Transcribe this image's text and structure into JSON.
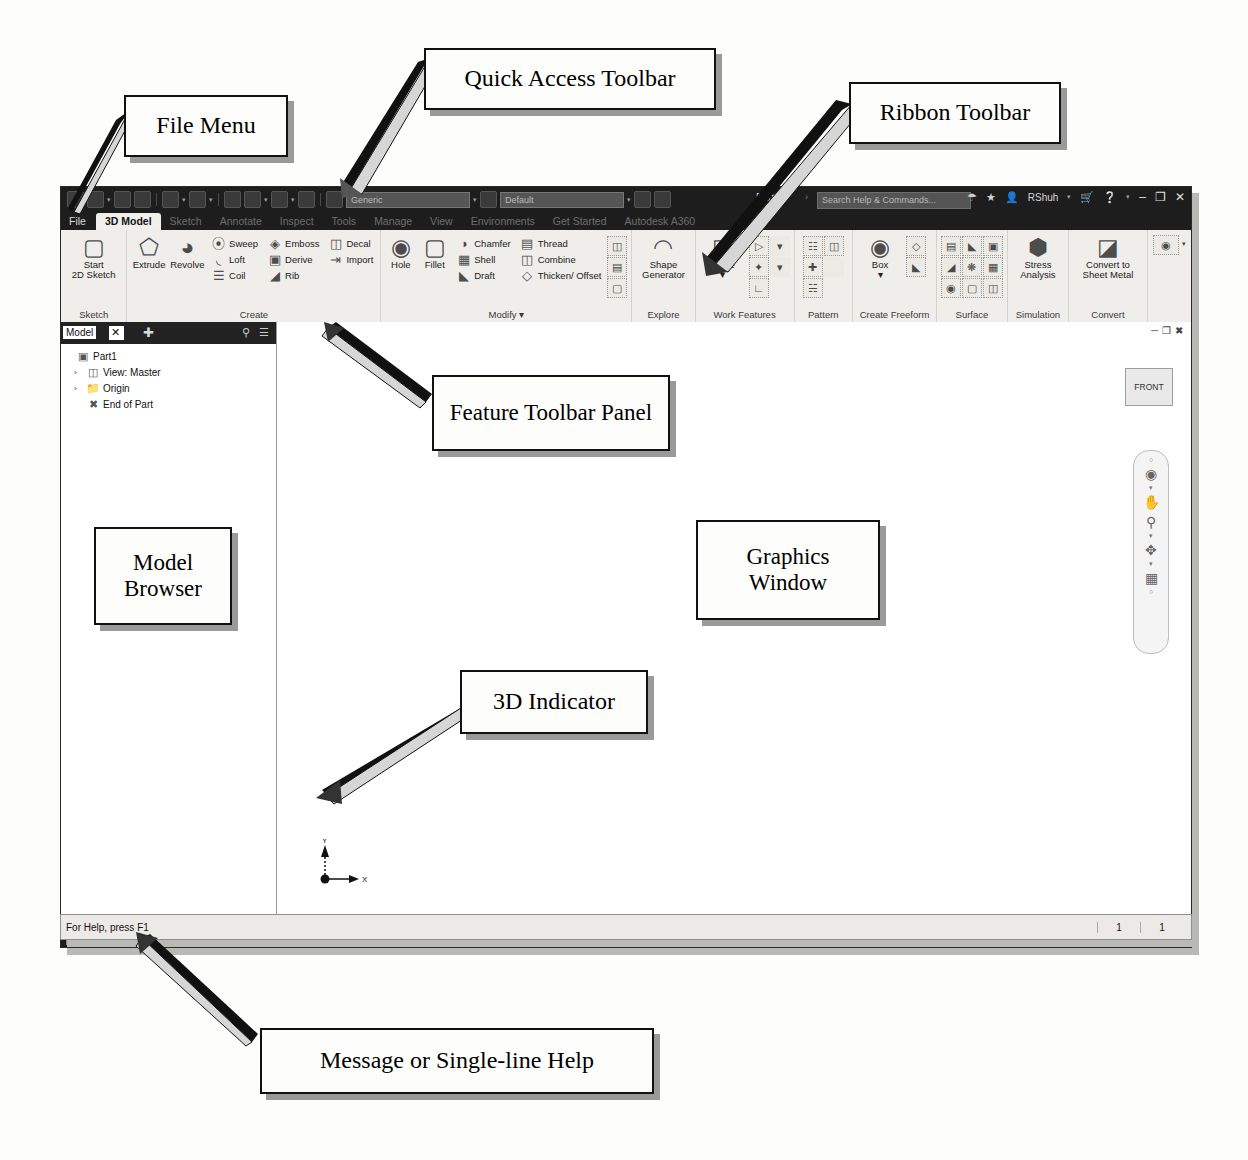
{
  "annotations": [
    {
      "id": "file-menu",
      "label": "File Menu"
    },
    {
      "id": "quick-access-toolbar",
      "label": "Quick Access Toolbar"
    },
    {
      "id": "ribbon-toolbar",
      "label": "Ribbon Toolbar"
    },
    {
      "id": "feature-toolbar-panel",
      "label": "Feature Toolbar Panel"
    },
    {
      "id": "model-browser",
      "label": "Model\nBrowser"
    },
    {
      "id": "graphics-window",
      "label": "Graphics\nWindow"
    },
    {
      "id": "3d-indicator",
      "label": "3D Indicator"
    },
    {
      "id": "message-help",
      "label": "Message or Single-line Help"
    }
  ],
  "annotation_text": {
    "file_menu": "File Menu",
    "quick_access_toolbar": "Quick Access Toolbar",
    "ribbon_toolbar": "Ribbon Toolbar",
    "feature_toolbar_panel": "Feature Toolbar Panel",
    "model_browser_l1": "Model",
    "model_browser_l2": "Browser",
    "graphics_window_l1": "Graphics",
    "graphics_window_l2": "Window",
    "three_d_indicator": "3D Indicator",
    "message_help": "Message or Single-line Help"
  },
  "titlebar": {
    "document_name": "Part1",
    "separator": "›",
    "search_placeholder": "Search Help & Commands...",
    "user_name": "RShuh",
    "material_selector": "Generic",
    "appearance_selector": "Default",
    "icons": [
      "save-icon",
      "open-icon",
      "print-icon",
      "undo-icon",
      "redo-icon",
      "home-icon",
      "update-icon",
      "material-icon",
      "appearance-icon",
      "sign-in-icon",
      "share-icon",
      "star-icon",
      "user-icon",
      "cart-icon",
      "help-icon"
    ],
    "minimize": "–",
    "maximize": "❐",
    "close": "✕"
  },
  "ribbon_tabs": [
    {
      "label": "File",
      "active": false,
      "file": true
    },
    {
      "label": "3D Model",
      "active": true,
      "file": false
    },
    {
      "label": "Sketch",
      "active": false,
      "file": false
    },
    {
      "label": "Annotate",
      "active": false,
      "file": false
    },
    {
      "label": "Inspect",
      "active": false,
      "file": false
    },
    {
      "label": "Tools",
      "active": false,
      "file": false
    },
    {
      "label": "Manage",
      "active": false,
      "file": false
    },
    {
      "label": "View",
      "active": false,
      "file": false
    },
    {
      "label": "Environments",
      "active": false,
      "file": false
    },
    {
      "label": "Get Started",
      "active": false,
      "file": false
    },
    {
      "label": "Autodesk A360",
      "active": false,
      "file": false
    }
  ],
  "ribbon_panels": {
    "sketch": {
      "title": "Sketch",
      "big": {
        "line1": "Start",
        "line2": "2D Sketch",
        "icon": "sketch-plane-icon",
        "caret": "▾"
      }
    },
    "create": {
      "title": "Create",
      "big": [
        {
          "label": "Extrude",
          "icon": "extrude-icon"
        },
        {
          "label": "Revolve",
          "icon": "revolve-icon"
        }
      ],
      "small": [
        [
          {
            "label": "Sweep",
            "icon": "sweep-icon"
          },
          {
            "label": "Loft",
            "icon": "loft-icon"
          },
          {
            "label": "Coil",
            "icon": "coil-icon"
          }
        ],
        [
          {
            "label": "Emboss",
            "icon": "emboss-icon"
          },
          {
            "label": "Derive",
            "icon": "derive-icon"
          },
          {
            "label": "Rib",
            "icon": "rib-icon"
          }
        ],
        [
          {
            "label": "Decal",
            "icon": "decal-icon"
          },
          {
            "label": "Import",
            "icon": "import-icon"
          }
        ]
      ]
    },
    "modify": {
      "title": "Modify",
      "caret": "▾",
      "big": [
        {
          "label": "Hole",
          "icon": "hole-icon"
        },
        {
          "label": "Fillet",
          "icon": "fillet-icon"
        }
      ],
      "small": [
        [
          {
            "label": "Chamfer",
            "icon": "chamfer-icon"
          },
          {
            "label": "Shell",
            "icon": "shell-icon"
          },
          {
            "label": "Draft",
            "icon": "draft-icon"
          }
        ],
        [
          {
            "label": "Thread",
            "icon": "thread-icon"
          },
          {
            "label": "Combine",
            "icon": "combine-icon"
          },
          {
            "label": "Thicken/ Offset",
            "icon": "thicken-offset-icon"
          }
        ]
      ],
      "tiles": [
        "split-icon",
        "direct-edit-icon",
        "delete-face-icon"
      ]
    },
    "explore": {
      "title": "Explore",
      "big": {
        "line1": "Shape",
        "line2": "Generator",
        "icon": "shape-generator-icon"
      }
    },
    "work_features": {
      "title": "Work Features",
      "big": {
        "line1": "Plane",
        "line2": "",
        "icon": "work-plane-icon",
        "caret": "▾"
      },
      "tiles": [
        "work-axis-icon",
        "axis-dropdown-icon",
        "work-point-icon",
        "point-dropdown-icon",
        "ucs-icon"
      ]
    },
    "pattern": {
      "title": "Pattern",
      "tiles": [
        "rectangular-pattern-icon",
        "mirror-icon",
        "circular-pattern-icon",
        "sketch-driven-pattern-icon"
      ]
    },
    "create_freeform": {
      "title": "Create Freeform",
      "big": {
        "line1": "Box",
        "line2": "",
        "icon": "freeform-box-icon",
        "caret": "▾"
      },
      "tiles": [
        "freeform-plane-icon",
        "freeform-convert-icon"
      ]
    },
    "surface": {
      "title": "Surface",
      "tiles": [
        "stitch-icon",
        "sculpt-icon",
        "patch-icon",
        "extend-icon",
        "trim-icon",
        "ruled-surface-icon",
        "replace-face-icon",
        "delete-face-s-icon",
        "copy-object-icon"
      ]
    },
    "simulation": {
      "title": "Simulation",
      "big": {
        "line1": "Stress",
        "line2": "Analysis",
        "icon": "stress-analysis-icon"
      }
    },
    "convert": {
      "title": "Convert",
      "big": {
        "line1": "Convert to",
        "line2": "Sheet Metal",
        "icon": "sheet-metal-icon"
      }
    },
    "overflow": {
      "tiles": [
        "appearance-override-icon"
      ],
      "caret": "▾"
    }
  },
  "browser": {
    "title": "Model",
    "close": "✕",
    "add": "✚",
    "search_icon": "search-icon",
    "menu_icon": "hamburger-icon",
    "tree": [
      {
        "label": "Part1",
        "indent": 0,
        "expander": "",
        "icon": "part-icon"
      },
      {
        "label": "View: Master",
        "indent": 1,
        "expander": "›",
        "icon": "view-icon"
      },
      {
        "label": "Origin",
        "indent": 1,
        "expander": "›",
        "icon": "folder-icon"
      },
      {
        "label": "End of Part",
        "indent": 1,
        "expander": "",
        "icon": "end-of-part-icon"
      }
    ]
  },
  "canvas": {
    "mdi_buttons": [
      "restore-icon",
      "maximize-icon",
      "close-icon"
    ],
    "viewcube_label": "FRONT",
    "navbar_tools": [
      "orbit-wheel-icon",
      "pan-icon",
      "zoom-icon",
      "orbit-icon",
      "look-at-icon"
    ],
    "axis_x": "X",
    "axis_y": "Y"
  },
  "doctabs": {
    "arrange_icons": [
      "tile-horizontal-icon",
      "tile-grid-icon",
      "tile-vertical-icon",
      "cascade-icon"
    ],
    "more": "▲",
    "tabs": [
      {
        "label": "My Home",
        "active": false,
        "close": ""
      },
      {
        "label": "Part1",
        "active": true,
        "close": "✕"
      }
    ]
  },
  "statusbar": {
    "message": "For Help, press F1",
    "cells": [
      "1",
      "1"
    ]
  }
}
